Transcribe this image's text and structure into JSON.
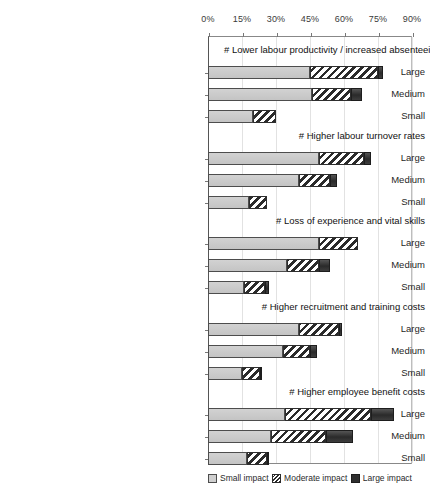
{
  "chart_data": {
    "type": "bar",
    "orientation": "horizontal",
    "stacked": true,
    "title": "",
    "xlabel": "",
    "ylabel": "",
    "xlim": [
      0,
      90
    ],
    "xticks": [
      "0%",
      "15%",
      "30%",
      "45%",
      "60%",
      "75%",
      "90%"
    ],
    "xtick_values": [
      0,
      15,
      30,
      45,
      60,
      75,
      90
    ],
    "grid": true,
    "legend_position": "bottom",
    "series": [
      {
        "name": "Small impact",
        "key": "small"
      },
      {
        "name": "Moderate impact",
        "key": "moderate"
      },
      {
        "name": "Large impact",
        "key": "large"
      }
    ],
    "groups": [
      {
        "label": "#  Lower labour productivity / increased absenteeism",
        "categories": [
          "Large",
          "Medium",
          "Small"
        ],
        "values": {
          "Large": {
            "small": 45,
            "moderate": 30,
            "large": 2
          },
          "Medium": {
            "small": 46,
            "moderate": 17,
            "large": 5
          },
          "Small": {
            "small": 20,
            "moderate": 10,
            "large": 0
          }
        }
      },
      {
        "label": "#  Higher labour turnover rates",
        "categories": [
          "Large",
          "Medium",
          "Small"
        ],
        "values": {
          "Large": {
            "small": 49,
            "moderate": 20,
            "large": 3
          },
          "Medium": {
            "small": 40,
            "moderate": 14,
            "large": 3
          },
          "Small": {
            "small": 18,
            "moderate": 8,
            "large": 0
          }
        }
      },
      {
        "label": "#  Loss of experience and vital skills",
        "categories": [
          "Large",
          "Medium",
          "Small"
        ],
        "values": {
          "Large": {
            "small": 49,
            "moderate": 17,
            "large": 0
          },
          "Medium": {
            "small": 35,
            "moderate": 14,
            "large": 5
          },
          "Small": {
            "small": 16,
            "moderate": 9,
            "large": 2
          }
        }
      },
      {
        "label": "#  Higher recruitment and training costs",
        "categories": [
          "Large",
          "Medium",
          "Small"
        ],
        "values": {
          "Large": {
            "small": 40,
            "moderate": 18,
            "large": 1
          },
          "Medium": {
            "small": 33,
            "moderate": 12,
            "large": 3
          },
          "Small": {
            "small": 15,
            "moderate": 8,
            "large": 1
          }
        }
      },
      {
        "label": "#  Higher employee benefit costs",
        "categories": [
          "Large",
          "Medium",
          "Small"
        ],
        "values": {
          "Large": {
            "small": 34,
            "moderate": 38,
            "large": 10
          },
          "Medium": {
            "small": 28,
            "moderate": 24,
            "large": 12
          },
          "Small": {
            "small": 17,
            "moderate": 9,
            "large": 1
          }
        }
      }
    ]
  },
  "colors": {
    "small_impact": "#c9c9c9",
    "moderate_impact": "#2b2b2b",
    "large_impact": "#2f2f2f",
    "axis": "#555555",
    "gridline": "#e2e2e2"
  }
}
